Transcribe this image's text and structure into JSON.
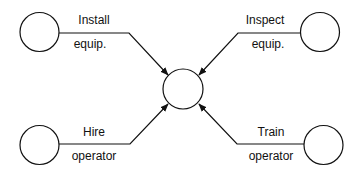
{
  "diagram": {
    "type": "activity-on-arrow network",
    "central_node": {
      "id": "center"
    },
    "activities": [
      {
        "id": "install",
        "line1": "Install",
        "line2": "equip.",
        "direction": "into-center"
      },
      {
        "id": "inspect",
        "line1": "Inspect",
        "line2": "equip.",
        "direction": "into-center"
      },
      {
        "id": "hire",
        "line1": "Hire",
        "line2": "operator",
        "direction": "into-center"
      },
      {
        "id": "train",
        "line1": "Train",
        "line2": "operator",
        "direction": "into-center"
      }
    ],
    "colors": {
      "stroke": "#111111",
      "background": "#ffffff"
    }
  }
}
